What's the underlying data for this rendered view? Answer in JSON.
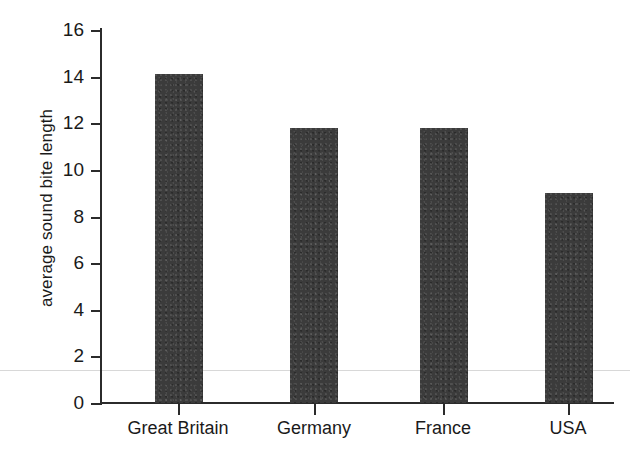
{
  "chart_data": {
    "type": "bar",
    "title": "",
    "xlabel": "",
    "ylabel": "average sound bite length",
    "categories": [
      "Great Britain",
      "Germany",
      "France",
      "USA"
    ],
    "values": [
      14.1,
      11.8,
      11.8,
      9.0
    ],
    "ylim": [
      0,
      16
    ],
    "yticks": [
      "0",
      "2",
      "4",
      "6",
      "8",
      "10",
      "12",
      "14",
      "16"
    ],
    "ytick_values": [
      0,
      2,
      4,
      6,
      8,
      10,
      12,
      14,
      16
    ],
    "grid": false,
    "legend": null,
    "bar_color": "#3b3b3b",
    "axis_color": "#2b2b2b",
    "background": "#ffffff"
  }
}
